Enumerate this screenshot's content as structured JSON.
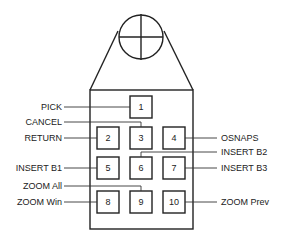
{
  "diagram": {
    "crosshair": {
      "cx": 141,
      "cy": 37,
      "r": 22
    },
    "buttons": [
      {
        "id": "1",
        "label": "1",
        "x": 130,
        "y": 96
      },
      {
        "id": "2",
        "label": "2",
        "x": 97,
        "y": 127
      },
      {
        "id": "3",
        "label": "3",
        "x": 130,
        "y": 127
      },
      {
        "id": "4",
        "label": "4",
        "x": 163,
        "y": 127
      },
      {
        "id": "5",
        "label": "5",
        "x": 97,
        "y": 157
      },
      {
        "id": "6",
        "label": "6",
        "x": 130,
        "y": 157
      },
      {
        "id": "7",
        "label": "7",
        "x": 163,
        "y": 157
      },
      {
        "id": "8",
        "label": "8",
        "x": 97,
        "y": 191
      },
      {
        "id": "9",
        "label": "9",
        "x": 130,
        "y": 191
      },
      {
        "id": "10",
        "label": "10",
        "x": 163,
        "y": 191
      }
    ],
    "callouts": {
      "pick": "PICK",
      "cancel": "CANCEL",
      "return": "RETURN",
      "osnaps": "OSNAPS",
      "insert_b1": "INSERT  B1",
      "insert_b2": "INSERT  B2",
      "insert_b3": "INSERT  B3",
      "zoom_all": "ZOOM  All",
      "zoom_win": "ZOOM  Win",
      "zoom_prev": "ZOOM  Prev"
    }
  }
}
